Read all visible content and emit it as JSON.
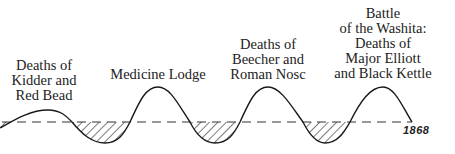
{
  "diagram": {
    "year": "1868",
    "events": [
      {
        "lines": [
          "Deaths of",
          "Kidder and",
          "Red Bead"
        ]
      },
      {
        "lines": [
          "Medicine Lodge"
        ]
      },
      {
        "lines": [
          "Deaths of",
          "Beecher and",
          "Roman Nosc"
        ]
      },
      {
        "lines": [
          "Battle",
          "of the Washita:",
          "Deaths of",
          "Major Elliott",
          "and Black Kettle"
        ]
      }
    ],
    "colors": {
      "line": "#1a1a1a",
      "background": "#ffffff"
    }
  }
}
